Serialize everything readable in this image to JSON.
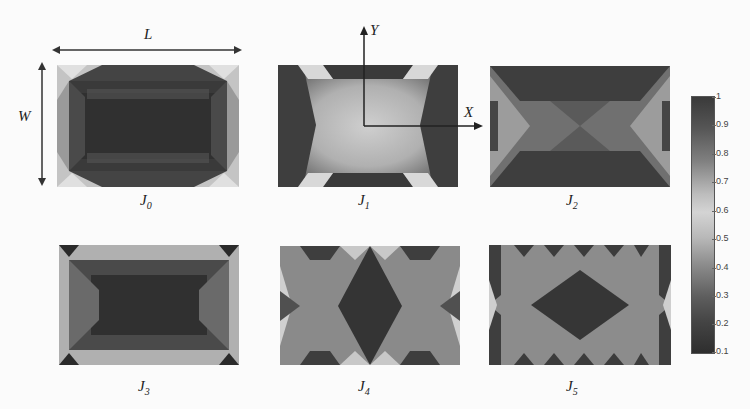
{
  "figure": {
    "dimension_labels": {
      "length": "L",
      "width": "W"
    },
    "axis_labels": {
      "x": "X",
      "y": "Y"
    },
    "panels": [
      {
        "id": "J0",
        "base": "J",
        "sub": "0"
      },
      {
        "id": "J1",
        "base": "J",
        "sub": "1"
      },
      {
        "id": "J2",
        "base": "J",
        "sub": "2"
      },
      {
        "id": "J3",
        "base": "J",
        "sub": "3"
      },
      {
        "id": "J4",
        "base": "J",
        "sub": "4"
      },
      {
        "id": "J5",
        "base": "J",
        "sub": "5"
      }
    ],
    "colorbar": {
      "min": 0.1,
      "max": 1,
      "ticks": [
        "1",
        "0.9",
        "0.8",
        "0.7",
        "0.6",
        "0.5",
        "0.4",
        "0.3",
        "0.2",
        "0.1"
      ],
      "colormap": "grayscale (dark high, light mid)"
    }
  }
}
